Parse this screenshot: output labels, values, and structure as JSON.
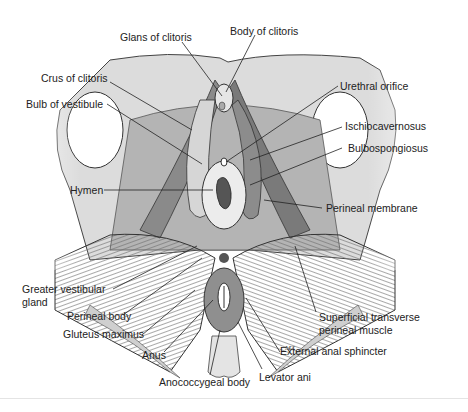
{
  "diagram": {
    "labels": {
      "glans_of_clitoris": "Glans of clitoris",
      "body_of_clitoris": "Body of clitoris",
      "crus_of_clitoris": "Crus of clitoris",
      "bulb_of_vestibule": "Bulb of vestibule",
      "urethral_orifice": "Urethral orifice",
      "ischiocavernosus": "Ischiocavernosus",
      "bulbospongiosus": "Bulbospongiosus",
      "hymen": "Hymen",
      "perineal_membrane": "Perineal membrane",
      "greater_vestibular_gland_1": "Greater vestibular",
      "greater_vestibular_gland_2": "gland",
      "perineal_body": "Perineal body",
      "gluteus_maximus": "Gluteus maximus",
      "anus": "Anus",
      "anococcygeal_body": "Anococcygeal body",
      "levator_ani": "Levator ani",
      "external_anal_sphincter": "External anal sphincter",
      "superficial_transverse_1": "Superficial transverse",
      "superficial_transverse_2": "perineal muscle"
    },
    "signature": "MZ"
  }
}
